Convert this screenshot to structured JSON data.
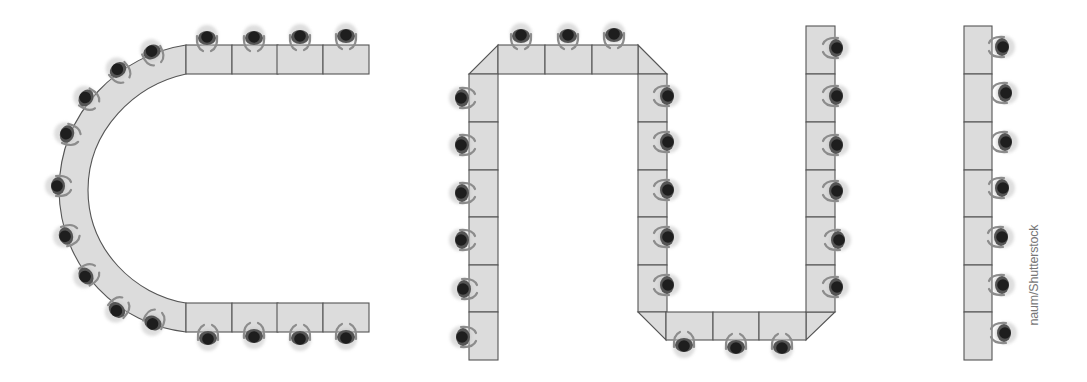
{
  "figure": {
    "credit": "naum/Shutterstock"
  },
  "colors": {
    "table_fill": "#dcdcdc",
    "table_stroke": "#555555",
    "head": "#1e1e1e",
    "body_dark": "#333333",
    "body_mid": "#6a6a6a",
    "arm": "#8c8c8c",
    "halo": "#bdbdbd"
  },
  "layouts": [
    {
      "name": "horseshoe",
      "seat_count": 18,
      "top_cells": [
        [
          186,
          45
        ],
        [
          232,
          45
        ],
        [
          277,
          45
        ],
        [
          323,
          45
        ]
      ],
      "bottom_cells": [
        [
          186,
          303
        ],
        [
          232,
          303
        ],
        [
          277,
          303
        ],
        [
          323,
          303
        ]
      ],
      "cell": [
        46,
        29
      ],
      "seats": [
        [
          207,
          38,
          0
        ],
        [
          254,
          38,
          0
        ],
        [
          300,
          37,
          0
        ],
        [
          346,
          36,
          0
        ],
        [
          152,
          52,
          -25
        ],
        [
          118,
          70,
          -40
        ],
        [
          86,
          98,
          -58
        ],
        [
          67,
          134,
          -72
        ],
        [
          58,
          186,
          -90
        ],
        [
          66,
          236,
          -108
        ],
        [
          86,
          276,
          -122
        ],
        [
          117,
          310,
          -140
        ],
        [
          153,
          323,
          -155
        ],
        [
          208,
          338,
          180
        ],
        [
          254,
          336,
          180
        ],
        [
          300,
          338,
          180
        ],
        [
          346,
          337,
          180
        ]
      ]
    },
    {
      "name": "serpentine",
      "seat_count": 24,
      "seats": [
        [
          521,
          36,
          0
        ],
        [
          568,
          36,
          0
        ],
        [
          614,
          35,
          0
        ],
        [
          462,
          98,
          -90
        ],
        [
          462,
          145,
          -90
        ],
        [
          462,
          193,
          -90
        ],
        [
          462,
          240,
          -90
        ],
        [
          464,
          289,
          -90
        ],
        [
          463,
          337,
          -90
        ],
        [
          667,
          96,
          90
        ],
        [
          667,
          142,
          90
        ],
        [
          667,
          190,
          90
        ],
        [
          667,
          237,
          90
        ],
        [
          667,
          285,
          90
        ],
        [
          684,
          345,
          180
        ],
        [
          736,
          347,
          180
        ],
        [
          782,
          347,
          180
        ],
        [
          836,
          48,
          90
        ],
        [
          836,
          96,
          90
        ],
        [
          836,
          145,
          90
        ],
        [
          836,
          191,
          90
        ],
        [
          838,
          240,
          90
        ],
        [
          836,
          287,
          90
        ]
      ]
    },
    {
      "name": "straight-row",
      "seat_count": 7,
      "cells_y": [
        26,
        74,
        122,
        170,
        217,
        265,
        312,
        360
      ],
      "seats": [
        [
          1002,
          47,
          90
        ],
        [
          1005,
          93,
          90
        ],
        [
          1005,
          142,
          90
        ],
        [
          1002,
          188,
          90
        ],
        [
          1001,
          237,
          90
        ],
        [
          1002,
          285,
          90
        ],
        [
          1004,
          333,
          90
        ]
      ]
    }
  ]
}
